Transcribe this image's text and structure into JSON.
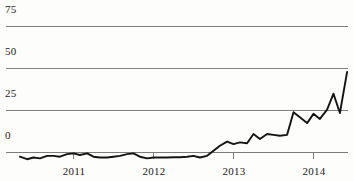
{
  "chart_data": {
    "type": "line",
    "title": "",
    "subtitle": "",
    "xlabel": "",
    "ylabel": "",
    "grid": true,
    "legend": null,
    "legend_position": "none",
    "ylim": [
      -8,
      75
    ],
    "yticks": [
      0,
      25,
      50,
      75
    ],
    "ytick_labels": [
      "0",
      "25",
      "50",
      "75"
    ],
    "xlim": [
      2010.33,
      2014.5
    ],
    "xticks": [
      2011,
      2012,
      2013,
      2014
    ],
    "xtick_labels": [
      "2011",
      "2012",
      "2013",
      "2014"
    ],
    "series": [
      {
        "name": "series-1",
        "color": "#141414",
        "x": [
          2010.33,
          2010.42,
          2010.5,
          2010.58,
          2010.67,
          2010.75,
          2010.83,
          2010.92,
          2011.0,
          2011.08,
          2011.17,
          2011.25,
          2011.33,
          2011.42,
          2011.5,
          2011.58,
          2011.67,
          2011.75,
          2011.83,
          2011.92,
          2012.0,
          2012.08,
          2012.17,
          2012.25,
          2012.33,
          2012.42,
          2012.5,
          2012.58,
          2012.67,
          2012.75,
          2012.83,
          2012.92,
          2013.0,
          2013.08,
          2013.17,
          2013.25,
          2013.33,
          2013.42,
          2013.5,
          2013.58,
          2013.67,
          2013.75,
          2013.83,
          2013.92,
          2014.0,
          2014.08,
          2014.17,
          2014.25,
          2014.33,
          2014.42
        ],
        "values": [
          -2.5,
          -4.0,
          -3.0,
          -3.5,
          -2.0,
          -2.0,
          -2.5,
          -1.0,
          -0.5,
          -1.5,
          -0.5,
          -2.5,
          -3.0,
          -3.0,
          -2.5,
          -2.0,
          -1.0,
          -0.5,
          -2.5,
          -3.5,
          -3.0,
          -3.0,
          -3.0,
          -2.8,
          -2.8,
          -2.5,
          -2.0,
          -3.0,
          -2.0,
          1.0,
          4.0,
          6.5,
          5.0,
          6.0,
          5.5,
          11.0,
          8.0,
          11.0,
          10.5,
          10.0,
          10.5,
          24.0,
          21.0,
          17.5,
          23.0,
          20.0,
          25.5,
          35.0,
          23.5,
          48.0
        ]
      }
    ]
  },
  "axes": {
    "y_labels": [
      {
        "text": "75",
        "value": 75
      },
      {
        "text": "50",
        "value": 50
      },
      {
        "text": "25",
        "value": 25
      },
      {
        "text": "0",
        "value": 0
      }
    ],
    "x_labels": [
      {
        "text": "2011",
        "value": 2011
      },
      {
        "text": "2012",
        "value": 2012
      },
      {
        "text": "2013",
        "value": 2013
      },
      {
        "text": "2014",
        "value": 2014
      }
    ]
  },
  "colors": {
    "line": "#141414",
    "grid": "#808080",
    "text": "#1a1a1a",
    "background": "#fdfdfc"
  }
}
